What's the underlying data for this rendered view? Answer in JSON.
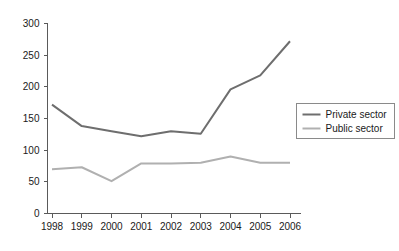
{
  "chart_data": {
    "type": "line",
    "title": "",
    "subtitle": "",
    "xlabel": "",
    "ylabel": "",
    "categories": [
      "1998",
      "1999",
      "2000",
      "2001",
      "2002",
      "2003",
      "2004",
      "2005",
      "2006"
    ],
    "series": [
      {
        "name": "Private sector",
        "color": "#6e6e6e",
        "values": [
          172,
          138,
          130,
          122,
          130,
          126,
          196,
          218,
          272
        ]
      },
      {
        "name": "Public sector",
        "color": "#b0b0b0",
        "values": [
          70,
          73,
          51,
          79,
          79,
          80,
          90,
          80,
          80
        ]
      }
    ],
    "ylim": [
      0,
      300
    ],
    "yticks": [
      0,
      50,
      100,
      150,
      200,
      250,
      300
    ],
    "ytick_labels": [
      "0",
      "50",
      "100",
      "150",
      "200",
      "250",
      "300"
    ],
    "xtick_labels": [
      "1998",
      "1999",
      "2000",
      "2001",
      "2002",
      "2003",
      "2004",
      "2005",
      "2006"
    ],
    "grid": false,
    "legend_position": "right-middle",
    "legend_entries": [
      "Private sector",
      "Public sector"
    ]
  },
  "legend": {
    "entry_0": "Private sector",
    "entry_1": "Public sector"
  },
  "axes": {
    "y_labels": [
      "300",
      "250",
      "200",
      "150",
      "100",
      "50",
      "0"
    ],
    "x_labels": [
      "1998",
      "1999",
      "2000",
      "2001",
      "2002",
      "2003",
      "2004",
      "2005",
      "2006"
    ]
  }
}
